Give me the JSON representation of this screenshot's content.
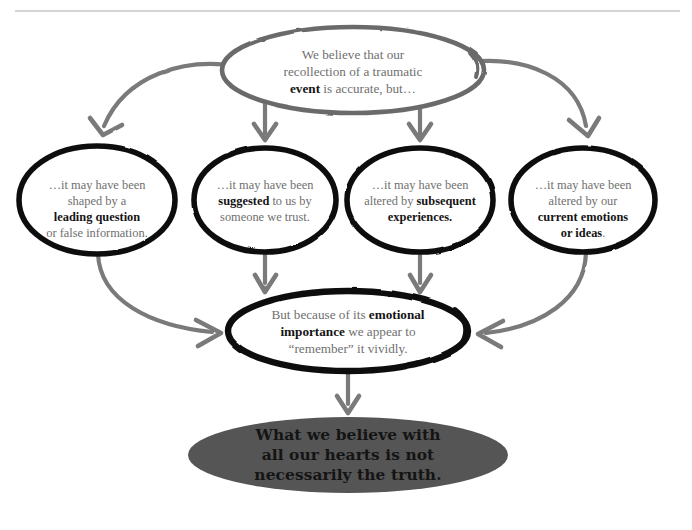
{
  "document": {
    "title": "Memory of traumatic events flow diagram",
    "type": "flow-diagram",
    "background_color": "#ffffff"
  },
  "colors": {
    "hand_drawn_gray_stroke": "#6b6b6b",
    "hand_drawn_black_stroke": "#111111",
    "arrow_gray": "#7a7a7a",
    "body_text_gray": "#6f6f6f",
    "emphasis_text_black": "#141414",
    "conclusion_ellipse_fill": "#555555",
    "top_rule": "#aaaaaa"
  },
  "top_rule": {
    "name": "horizontal-rule",
    "x1": 15,
    "x2": 680,
    "y": 11
  },
  "nodes": {
    "premise": {
      "id": "premise-oval",
      "shape": "ellipse",
      "stroke": "gray",
      "cx": 353,
      "cy": 70,
      "rx": 130,
      "ry": 43,
      "lines": [
        {
          "segments": [
            {
              "text": "We believe that our",
              "bold": false
            }
          ]
        },
        {
          "segments": [
            {
              "text": "recollection of a traumatic",
              "bold": false
            }
          ]
        },
        {
          "segments": [
            {
              "text": "event",
              "bold": true
            },
            {
              "text": " is accurate, but…",
              "bold": false
            }
          ]
        }
      ]
    },
    "branches": [
      {
        "id": "branch-leading-question",
        "shape": "ellipse",
        "stroke": "black",
        "cx": 97,
        "cy": 200,
        "rx": 78,
        "ry": 54,
        "lines": [
          {
            "segments": [
              {
                "text": "…it may have been",
                "bold": false
              }
            ]
          },
          {
            "segments": [
              {
                "text": "shaped by a",
                "bold": false
              }
            ]
          },
          {
            "segments": [
              {
                "text": "leading question",
                "bold": true
              }
            ]
          },
          {
            "segments": [
              {
                "text": "or false information.",
                "bold": false
              }
            ]
          }
        ]
      },
      {
        "id": "branch-suggested",
        "shape": "ellipse",
        "stroke": "black",
        "cx": 265,
        "cy": 200,
        "rx": 71,
        "ry": 52,
        "lines": [
          {
            "segments": [
              {
                "text": "…it may have been",
                "bold": false
              }
            ]
          },
          {
            "segments": [
              {
                "text": "suggested",
                "bold": true
              },
              {
                "text": " to us by",
                "bold": false
              }
            ]
          },
          {
            "segments": [
              {
                "text": "someone we trust.",
                "bold": false
              }
            ]
          }
        ]
      },
      {
        "id": "branch-subsequent-experiences",
        "shape": "ellipse",
        "stroke": "black",
        "cx": 420,
        "cy": 200,
        "rx": 73,
        "ry": 52,
        "lines": [
          {
            "segments": [
              {
                "text": "…it may have been",
                "bold": false
              }
            ]
          },
          {
            "segments": [
              {
                "text": "altered by ",
                "bold": false
              },
              {
                "text": "subsequent",
                "bold": true
              }
            ]
          },
          {
            "segments": [
              {
                "text": "experiences.",
                "bold": true
              }
            ]
          }
        ]
      },
      {
        "id": "branch-current-emotions",
        "shape": "ellipse",
        "stroke": "black",
        "cx": 583,
        "cy": 200,
        "rx": 72,
        "ry": 52,
        "lines": [
          {
            "segments": [
              {
                "text": "…it may have been",
                "bold": false
              }
            ]
          },
          {
            "segments": [
              {
                "text": "altered by our",
                "bold": false
              }
            ]
          },
          {
            "segments": [
              {
                "text": "current emotions",
                "bold": true
              }
            ]
          },
          {
            "segments": [
              {
                "text": "or ideas",
                "bold": true
              },
              {
                "text": ".",
                "bold": false
              }
            ]
          }
        ]
      }
    ],
    "synthesis": {
      "id": "synthesis-oval",
      "shape": "ellipse",
      "stroke": "black",
      "cx": 348,
      "cy": 331,
      "rx": 120,
      "ry": 40,
      "lines": [
        {
          "segments": [
            {
              "text": "But because of its ",
              "bold": false
            },
            {
              "text": "emotional",
              "bold": true
            }
          ]
        },
        {
          "segments": [
            {
              "text": "importance",
              "bold": true
            },
            {
              "text": " we appear to",
              "bold": false
            }
          ]
        },
        {
          "segments": [
            {
              "text": "“remember” it vividly.",
              "bold": false
            }
          ]
        }
      ]
    },
    "conclusion": {
      "id": "conclusion-ellipse",
      "shape": "ellipse",
      "fill": "#555555",
      "cx": 348,
      "cy": 455,
      "rx": 160,
      "ry": 38,
      "lines": [
        {
          "segments": [
            {
              "text": "What we believe with",
              "bold": true
            }
          ]
        },
        {
          "segments": [
            {
              "text": "all our hearts is not",
              "bold": true
            }
          ]
        },
        {
          "segments": [
            {
              "text": "necessarily the truth.",
              "bold": true
            }
          ]
        }
      ]
    }
  },
  "connectors": [
    {
      "name": "arrow-premise-to-leading-question",
      "from": "premise",
      "to": "branch-leading-question",
      "style": "curved",
      "direction": "down-left"
    },
    {
      "name": "arrow-premise-to-suggested",
      "from": "premise",
      "to": "branch-suggested",
      "style": "straight",
      "direction": "down"
    },
    {
      "name": "arrow-premise-to-subsequent",
      "from": "premise",
      "to": "branch-subsequent-experiences",
      "style": "straight",
      "direction": "down"
    },
    {
      "name": "arrow-premise-to-current-emotions",
      "from": "premise",
      "to": "branch-current-emotions",
      "style": "curved",
      "direction": "down-right"
    },
    {
      "name": "arrow-leading-question-to-synthesis",
      "from": "branch-leading-question",
      "to": "synthesis",
      "style": "curved",
      "direction": "down-right"
    },
    {
      "name": "arrow-suggested-to-synthesis",
      "from": "branch-suggested",
      "to": "synthesis",
      "style": "straight",
      "direction": "down"
    },
    {
      "name": "arrow-subsequent-to-synthesis",
      "from": "branch-subsequent-experiences",
      "to": "synthesis",
      "style": "straight",
      "direction": "down"
    },
    {
      "name": "arrow-current-emotions-to-synthesis",
      "from": "branch-current-emotions",
      "to": "synthesis",
      "style": "curved",
      "direction": "down-left"
    },
    {
      "name": "arrow-synthesis-to-conclusion",
      "from": "synthesis",
      "to": "conclusion",
      "style": "straight",
      "direction": "down"
    }
  ]
}
